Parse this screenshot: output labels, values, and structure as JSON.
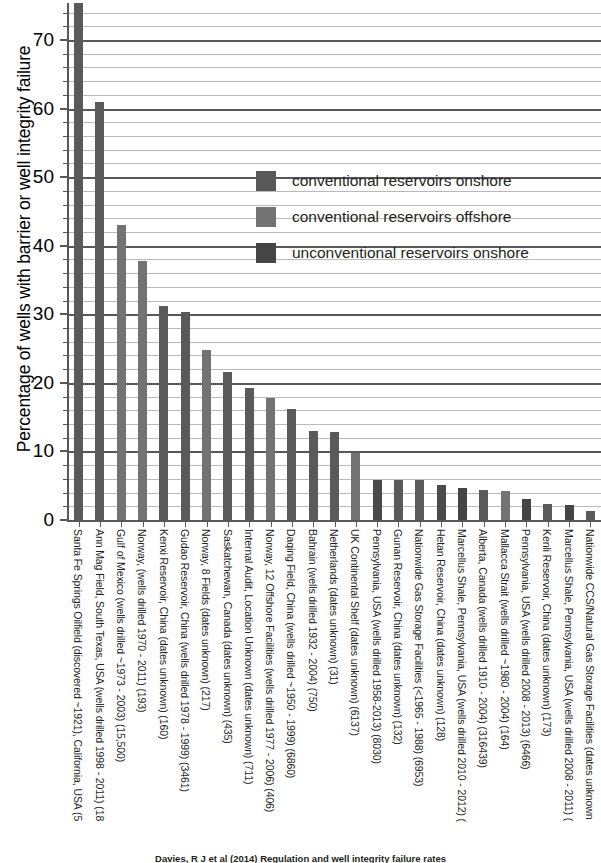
{
  "chart_data": {
    "type": "bar",
    "title": "",
    "xlabel": "",
    "ylabel": "Percentage of wells with barrier or well integrity failure",
    "ylim": [
      0,
      75.4
    ],
    "yticks": [
      0,
      10,
      20,
      30,
      40,
      50,
      60,
      70
    ],
    "ytick_labels": [
      "0",
      "10",
      "20",
      "30",
      "40",
      "50",
      "60",
      "70"
    ],
    "minor_tick_step": 2,
    "grid": true,
    "legend_position": "center",
    "legend": [
      {
        "label": "conventional reservoirs onshore",
        "color": "#595959"
      },
      {
        "label": "conventional reservoirs offshore",
        "color": "#737373"
      },
      {
        "label": "unconventional reservoirs onshore",
        "color": "#454545"
      }
    ],
    "categories": [
      "Santa Fe Springs Oilfield (discovered ~1921), California, USA (5",
      "Ann Mag Field, South Texas, USA (wells drilled 1998 - 2011) (18",
      "Gulf of Mexico (wells drilled ~1973 - 2003) (15,500)",
      "Norway, (wells drilled 1970 - 2011) (193)",
      "Kenxi Reservoir, China (dates unknown) (160)",
      "Gudao Reservoir, China (wells drilled 1978 - 1999) (3461)",
      "Norway, 8 Fields (dates unknown) (217)",
      "Saskatchewan, Canada (dates unknown) (435)",
      "Internal Audit, Location Unknown (dates unknown) (711)",
      "Norway, 12 Offshore Facilities (wells drilled 1977 - 2006) (406)",
      "Daqing Field, China (wells drilled ~1950 - 1999) (6860)",
      "Bahrain (wells drilled 1932 - 2004) (750)",
      "Netherlands (dates unknown) (31)",
      "UK Continental Shelf (dates unknown) (6137)",
      "Pennsylvania, USA (wells drilled 1958-2013) (8030)",
      "Gunan Reservoir, China (dates unknown) (132)",
      "Nationwide Gas Storage Facilities (<1965 - 1988) (6953)",
      "Hetan Reservoir, China (dates unknown) (128)",
      "Marcellus Shale, Pennsylvania, USA (wells drilled 2010 - 2012) (",
      "Alberta, Canada (wells drilled 1910 - 2004) (316439)",
      "Mallacca Strait (wells drilled ~1980 - 2004) (164)",
      "Pennsylvania, USA (wells drilled 2008 - 2013) (6466)",
      "Kenli Reservoir, China (dates unknown) (173)",
      "Marcellus Shale, Pennsylvania, USA (wells drilled 2008 - 2011) (",
      "Nationwide CCS/Natural Gas Storage Facilities (dates unknown"
    ],
    "values": [
      75.4,
      61.0,
      43.0,
      37.8,
      31.2,
      30.3,
      24.8,
      21.6,
      19.3,
      17.8,
      16.2,
      13.0,
      12.8,
      9.8,
      5.8,
      5.8,
      5.8,
      5.1,
      4.6,
      4.4,
      4.2,
      3.0,
      2.4,
      2.2,
      1.3
    ],
    "series_kind": [
      "conventional reservoirs onshore",
      "conventional reservoirs onshore",
      "conventional reservoirs offshore",
      "conventional reservoirs offshore",
      "conventional reservoirs onshore",
      "conventional reservoirs onshore",
      "conventional reservoirs offshore",
      "conventional reservoirs onshore",
      "conventional reservoirs onshore",
      "conventional reservoirs offshore",
      "conventional reservoirs onshore",
      "conventional reservoirs onshore",
      "conventional reservoirs onshore",
      "conventional reservoirs offshore",
      "conventional reservoirs onshore",
      "conventional reservoirs onshore",
      "conventional reservoirs onshore",
      "conventional reservoirs onshore",
      "unconventional reservoirs onshore",
      "conventional reservoirs onshore",
      "conventional reservoirs offshore",
      "conventional reservoirs onshore",
      "conventional reservoirs onshore",
      "unconventional reservoirs onshore",
      "conventional reservoirs onshore"
    ],
    "bar_colors": [
      "#5a5a5a",
      "#5a5a5a",
      "#737373",
      "#737373",
      "#5a5a5a",
      "#5a5a5a",
      "#737373",
      "#5a5a5a",
      "#5a5a5a",
      "#737373",
      "#5a5a5a",
      "#5a5a5a",
      "#5a5a5a",
      "#737373",
      "#4a4a4a",
      "#5a5a5a",
      "#5a5a5a",
      "#4a4a4a",
      "#454545",
      "#5a5a5a",
      "#737373",
      "#454545",
      "#5a5a5a",
      "#454545",
      "#5a5a5a"
    ]
  },
  "caption": {
    "text": "Davies, R J et al (2014) Regulation and well integrity failure rates"
  }
}
